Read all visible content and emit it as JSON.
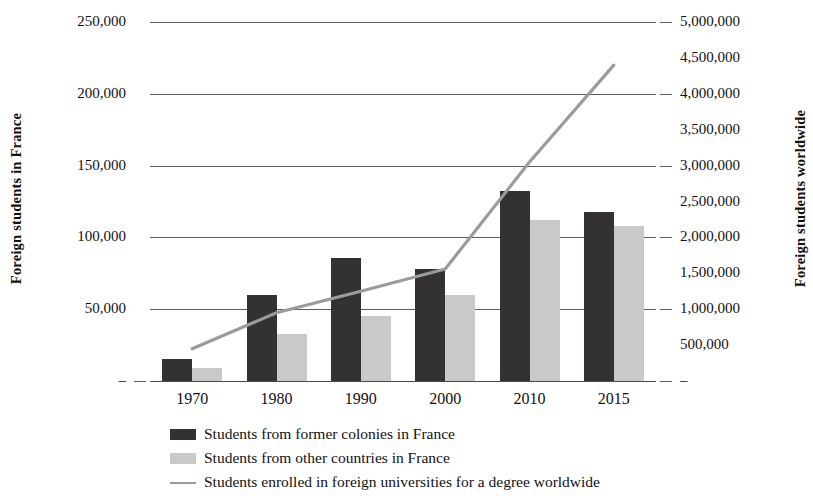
{
  "chart_data": {
    "type": "bar",
    "title": "",
    "subtitle": "",
    "categories": [
      "1970",
      "1980",
      "1990",
      "2000",
      "2010",
      "2015"
    ],
    "xlabel": "",
    "grid": true,
    "legend_position": "bottom",
    "axes": {
      "left": {
        "label": "Foreign students in France",
        "ylim": [
          0,
          250000
        ],
        "ticks": [
          250000,
          200000,
          150000,
          100000,
          50000,
          0
        ],
        "tick_labels": [
          "250,000",
          "200,000",
          "150,000",
          "100,000",
          "50,000",
          "–"
        ]
      },
      "right": {
        "label": "Foreign students worldwide",
        "ylim": [
          0,
          5000000
        ],
        "ticks": [
          5000000,
          4500000,
          4000000,
          3500000,
          3000000,
          2500000,
          2000000,
          1500000,
          1000000,
          500000,
          0
        ],
        "tick_labels": [
          "5,000,000",
          "4,500,000",
          "4,000,000",
          "3,500,000",
          "3,000,000",
          "2,500,000",
          "2,000,000",
          "1,500,000",
          "1,000,000",
          "500,000",
          "–"
        ]
      }
    },
    "series": [
      {
        "name": "Students from former colonies in France",
        "type": "bar",
        "axis": "left",
        "color": "#333132",
        "values": [
          15000,
          60000,
          86000,
          78000,
          132000,
          118000
        ]
      },
      {
        "name": "Students from other countries in France",
        "type": "bar",
        "axis": "left",
        "color": "#c9c9c7",
        "values": [
          9000,
          33000,
          45000,
          60000,
          112000,
          108000
        ]
      },
      {
        "name": "Students enrolled in foreign universities for a degree worldwide",
        "type": "line",
        "axis": "right",
        "color": "#9b9b9b",
        "values": [
          450000,
          950000,
          1250000,
          1560000,
          3050000,
          4400000
        ]
      }
    ]
  },
  "legend": {
    "items": [
      {
        "label": "Students from former colonies in France",
        "marker": "dark-square",
        "color": "#333132"
      },
      {
        "label": "Students from other countries in France",
        "marker": "light-square",
        "color": "#c9c9c7"
      },
      {
        "label": "Students enrolled in foreign universities for a degree worldwide",
        "marker": "gray-line",
        "color": "#9b9b9b"
      }
    ]
  }
}
